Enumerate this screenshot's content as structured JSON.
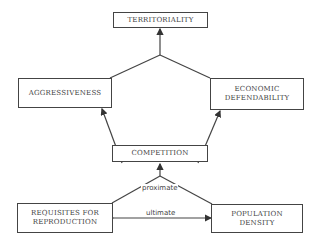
{
  "diagram": {
    "nodes": {
      "territoriality": "TERRITORIALITY",
      "aggressiveness": "AGGRESSIVENESS",
      "economic_defendability_line1": "ECONOMIC",
      "economic_defendability_line2": "DEFENDABILITY",
      "competition": "COMPETITION",
      "requisites_line1": "REQUISITES FOR",
      "requisites_line2": "REPRODUCTION",
      "population_line1": "POPULATION",
      "population_line2": "DENSITY"
    },
    "edge_labels": {
      "proximate": "proximate",
      "ultimate": "ultimate"
    },
    "edges": [
      {
        "from": "aggressiveness",
        "to": "territoriality"
      },
      {
        "from": "economic_defendability",
        "to": "territoriality"
      },
      {
        "from": "competition",
        "to": "aggressiveness"
      },
      {
        "from": "competition",
        "to": "economic_defendability"
      },
      {
        "from": "requisites_for_reproduction",
        "to": "competition",
        "label": "proximate"
      },
      {
        "from": "population_density",
        "to": "competition",
        "label": "proximate"
      },
      {
        "from": "requisites_for_reproduction",
        "to": "population_density",
        "label": "ultimate",
        "bidirectional": true
      }
    ]
  }
}
